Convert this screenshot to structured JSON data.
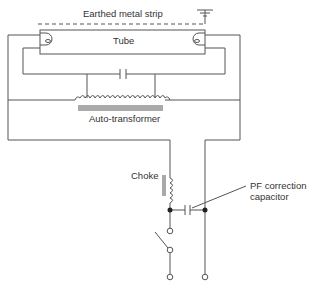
{
  "diagram": {
    "type": "circuit",
    "labels": {
      "earth_strip": "Earthed metal strip",
      "tube": "Tube",
      "auto_transformer": "Auto-transformer",
      "choke": "Choke",
      "pf_line1": "PF correction",
      "pf_line2": "capacitor"
    },
    "components": [
      "earthed metal strip",
      "ground",
      "tube",
      "starter capacitor",
      "auto-transformer",
      "choke",
      "PF correction capacitor",
      "switch",
      "supply terminals"
    ],
    "colors": {
      "line": "#555555",
      "text": "#333333"
    }
  }
}
